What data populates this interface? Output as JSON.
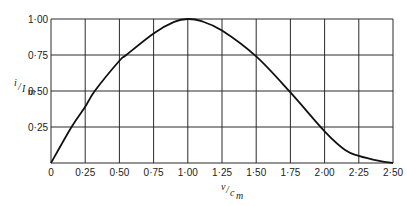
{
  "chart_data": {
    "type": "line",
    "title": "",
    "xlabel": "v/c_m",
    "ylabel": "i/I_m",
    "xlim": [
      0,
      2.5
    ],
    "ylim": [
      0,
      1.0
    ],
    "grid": true,
    "legend": null,
    "x_ticks": [
      0,
      0.25,
      0.5,
      0.75,
      1.0,
      1.25,
      1.5,
      1.75,
      2.0,
      2.25,
      2.5
    ],
    "x_tick_labels": [
      "0",
      "0·25",
      "0·50",
      "0·75",
      "1·00",
      "1·25",
      "1·50",
      "1·75",
      "2·00",
      "2·25",
      "2·50"
    ],
    "y_ticks": [
      0.25,
      0.5,
      0.75,
      1.0
    ],
    "y_tick_labels": [
      "0·25",
      "0·50",
      "0·75",
      "1·00"
    ],
    "series": [
      {
        "name": "i/I_m",
        "x": [
          0,
          0.15,
          0.25,
          0.32,
          0.5,
          0.55,
          0.75,
          0.9,
          1.0,
          1.1,
          1.25,
          1.5,
          1.75,
          2.0,
          2.15,
          2.25,
          2.4,
          2.5
        ],
        "values": [
          0,
          0.25,
          0.39,
          0.5,
          0.71,
          0.75,
          0.9,
          0.98,
          1.0,
          0.985,
          0.92,
          0.74,
          0.49,
          0.22,
          0.09,
          0.05,
          0.015,
          0.0
        ]
      }
    ]
  },
  "labels": {
    "xlabel_num": "v",
    "xlabel_den": "c",
    "xlabel_sub": "m",
    "ylabel_num": "i",
    "ylabel_den": "I",
    "ylabel_sub": "m"
  }
}
